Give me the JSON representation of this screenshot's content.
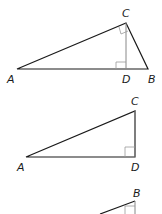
{
  "figures": [
    {
      "name": "triangle-ABC-with-altitude",
      "labels": {
        "A": "A",
        "B": "B",
        "C": "C",
        "D": "D"
      },
      "vertices": {
        "A": [
          17,
          69
        ],
        "B": [
          148,
          69
        ],
        "C": [
          126,
          23
        ],
        "D": [
          126,
          69
        ]
      },
      "right_angles": [
        "ACB",
        "CDA"
      ]
    },
    {
      "name": "triangle-ADC",
      "labels": {
        "A": "A",
        "C": "C",
        "D": "D"
      },
      "vertices": {
        "A": [
          26,
          157
        ],
        "C": [
          135,
          111
        ],
        "D": [
          135,
          157
        ]
      },
      "right_angles": [
        "CDA"
      ]
    },
    {
      "name": "triangle-partial-B",
      "labels": {
        "B": "B"
      },
      "vertices": {
        "B": [
          135,
          201
        ]
      },
      "right_angles": [
        "at-D"
      ]
    }
  ],
  "colors": {
    "line": "#1a1a1a",
    "altitude": "#888888",
    "right_angle_mark": "#999999"
  }
}
